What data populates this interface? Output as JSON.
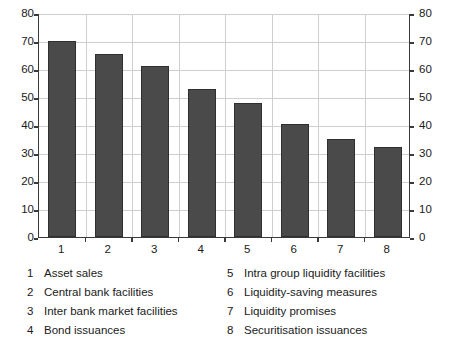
{
  "chart_data": {
    "type": "bar",
    "title": "",
    "xlabel": "",
    "ylabel": "",
    "categories": [
      "1",
      "2",
      "3",
      "4",
      "5",
      "6",
      "7",
      "8"
    ],
    "values": [
      70,
      65.5,
      61,
      53,
      48,
      40.3,
      35,
      32
    ],
    "ylim": [
      0,
      80
    ],
    "y_ticks": [
      0,
      10,
      20,
      30,
      40,
      50,
      60,
      70,
      80
    ],
    "y_tick_labels": [
      "0",
      "10",
      "20",
      "30",
      "40",
      "50",
      "60",
      "70",
      "80"
    ],
    "dual_axis": true,
    "right_axis_ticks": [
      0,
      10,
      20,
      30,
      40,
      50,
      60,
      70,
      80
    ],
    "right_axis_tick_labels": [
      "0",
      "10",
      "20",
      "30",
      "40",
      "50",
      "60",
      "70",
      "80"
    ],
    "grid": true,
    "legend_position": "below",
    "bar_color": "#4a4a4a",
    "bar_edge_color": "#2f2f2f",
    "grid_color": "#cfcfcf",
    "axis_color": "#3a3a3a"
  },
  "legend": {
    "left_column": [
      {
        "num": "1",
        "label": "Asset sales"
      },
      {
        "num": "2",
        "label": "Central bank facilities"
      },
      {
        "num": "3",
        "label": "Inter bank market facilities"
      },
      {
        "num": "4",
        "label": "Bond issuances"
      }
    ],
    "right_column": [
      {
        "num": "5",
        "label": "Intra group liquidity facilities"
      },
      {
        "num": "6",
        "label": "Liquidity-saving measures"
      },
      {
        "num": "7",
        "label": "Liquidity promises"
      },
      {
        "num": "8",
        "label": "Securitisation issuances"
      }
    ]
  }
}
